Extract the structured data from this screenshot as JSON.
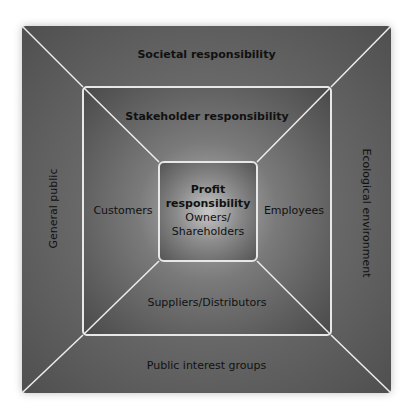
{
  "diagram": {
    "outer_ring": {
      "title": "Societal responsibility",
      "left": "General public",
      "right": "Ecological environment",
      "bottom": "Public interest groups"
    },
    "middle_ring": {
      "title": "Stakeholder responsibility",
      "left": "Customers",
      "right": "Employees",
      "bottom": "Suppliers/Distributors"
    },
    "center": {
      "title_line1": "Profit",
      "title_line2": "responsibility",
      "sub_line1": "Owners/",
      "sub_line2": "Shareholders"
    }
  }
}
